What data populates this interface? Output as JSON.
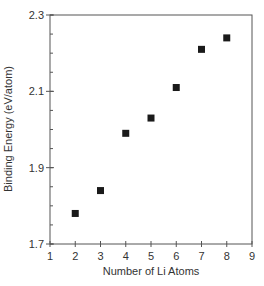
{
  "chart_data": {
    "type": "scatter",
    "title": "",
    "xlabel": "Number of Li Atoms",
    "ylabel": "Binding Energy (eV/atom)",
    "xlim": [
      1,
      9
    ],
    "ylim": [
      1.7,
      2.3
    ],
    "x_ticks": [
      1,
      2,
      3,
      4,
      5,
      6,
      7,
      8,
      9
    ],
    "x_tick_labels": [
      "1",
      "2",
      "3",
      "4",
      "5",
      "6",
      "7",
      "8",
      "9"
    ],
    "y_ticks": [
      1.7,
      1.9,
      2.1,
      2.3
    ],
    "y_tick_labels": [
      "1.7",
      "1.9",
      "2.1",
      "2.3"
    ],
    "y_minor_step": 0.05,
    "grid": false,
    "legend": null,
    "marker": "filled-square",
    "marker_color": "#1a1a1a",
    "axis_color": "#555555",
    "series": [
      {
        "name": "Binding Energy",
        "x": [
          2,
          3,
          4,
          5,
          6,
          7,
          8
        ],
        "y": [
          1.78,
          1.84,
          1.99,
          2.03,
          2.11,
          2.21,
          2.24
        ]
      }
    ]
  }
}
